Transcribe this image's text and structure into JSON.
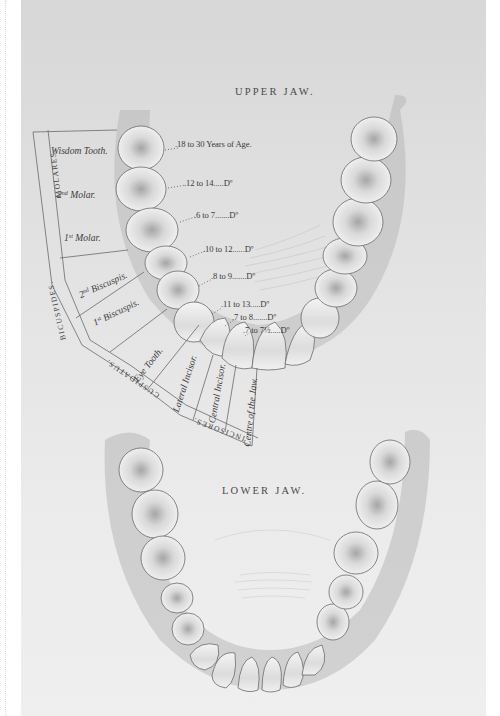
{
  "plate": {
    "upper_jaw_title": "UPPER JAW.",
    "lower_jaw_title": "LOWER JAW.",
    "eruption_ages": [
      {
        "tooth": "Wisdom Tooth",
        "age": "18 to 30 Years of Age"
      },
      {
        "tooth": "2nd Molar",
        "age": "12 to 14",
        "ditto": "Dº"
      },
      {
        "tooth": "1st Molar",
        "age": "6 to 7",
        "ditto": "Dº"
      },
      {
        "tooth": "2nd Bicuspis",
        "age": "10 to 12",
        "ditto": "Dº"
      },
      {
        "tooth": "1st Bicuspis",
        "age": "8 to 9",
        "ditto": "Dº"
      },
      {
        "tooth": "Eye Tooth",
        "age": "11 to 13",
        "ditto": "Dº"
      },
      {
        "tooth": "Lateral Incisor",
        "age": "7 to 8",
        "ditto": "Dº"
      },
      {
        "tooth": "Central Incisor",
        "age": "7 to 7½",
        "ditto": "Dº"
      }
    ],
    "age_text": {
      "a0": ".18 to 30 Years of Age.",
      "a1": ".12 to 14.....Dº",
      "a2": ".6 to 7.......Dº",
      "a3": ".10 to 12......Dº",
      "a4": ".8 to 9.......Dº",
      "a5": ".11 to 13.....Dº",
      "a6": ".7 to 8.......Dº",
      "a7": ".7 to 7½.....Dº"
    },
    "tooth_labels": {
      "wisdom": "Wisdom Tooth.",
      "molar2_num": "2",
      "molar2_sup": "nd",
      "molar2": " Molar.",
      "molar1_num": "1",
      "molar1_sup": "st",
      "molar1": " Molar.",
      "bicus2_num": "2",
      "bicus2_sup": "nd",
      "bicus2": " Biscuspis.",
      "bicus1_num": "1",
      "bicus1_sup": "st",
      "bicus1": " Biscuspis.",
      "eye": "Eye Tooth.",
      "lateral": "Lateral Incisor.",
      "central": "Central Incisor.",
      "centre": "Centre of the Jaw."
    },
    "group_labels": {
      "molares": "MOLARES.",
      "bicuspides": "BICUSPIDES.",
      "cuspidatus": "CUSPIDATUS.",
      "incisores": "INCISORES."
    },
    "colors": {
      "paper_top": "#d7d7d7",
      "paper_bottom": "#efefef",
      "ink": "#3c3c3c",
      "tooth_fill": "#f1f1f1",
      "tooth_shade": "#9a9a9a"
    }
  }
}
